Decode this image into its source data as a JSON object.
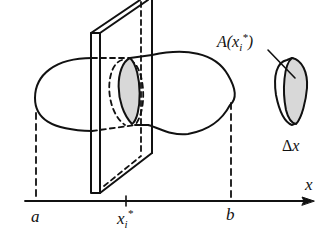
{
  "diagram": {
    "colors": {
      "stroke": "#111111",
      "shaded": "#d8d8d8",
      "background": "#ffffff"
    },
    "axis": {
      "label": "x",
      "ticks": [
        {
          "id": "a",
          "label": "a"
        },
        {
          "id": "xi",
          "label": "x",
          "sub": "i",
          "sup": "*"
        },
        {
          "id": "b",
          "label": "b"
        }
      ]
    },
    "annotations": {
      "area": {
        "fn": "A(x",
        "sub": "i",
        "sup": "*",
        "close": ")"
      },
      "thickness": {
        "delta": "Δ",
        "var": "x"
      }
    }
  }
}
